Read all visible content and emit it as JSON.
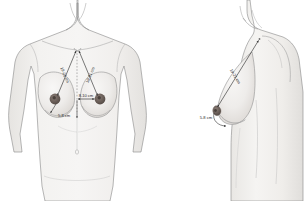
{
  "figure": {
    "background_color": "#ffffff",
    "skin_fill": "#efeeec",
    "skin_fill_shadow": "#e2e0dd",
    "outline_color": "#8a8a8a",
    "areola_color": "#6e6460",
    "measure_line_color": "#3a3a3a",
    "label_color": "#2b2b2b",
    "views": [
      {
        "name": "anterior-view",
        "label": "Anterior (frontal) view",
        "measurements": [
          {
            "id": "sternal-notch-to-left-nipple",
            "text": "19-21 cm",
            "description": "Suprasternal notch to nipple, patient left",
            "orientation": "diagonal"
          },
          {
            "id": "sternal-notch-to-right-nipple",
            "text": "19-21 cm",
            "description": "Suprasternal notch to nipple, patient right",
            "orientation": "diagonal"
          },
          {
            "id": "midline-to-nipple",
            "text": "8-10 cm",
            "description": "Anterior midline to nipple",
            "orientation": "horizontal"
          },
          {
            "id": "nipple-to-inframammary-fold-front",
            "text": "5-8 cm",
            "description": "Nipple to inframammary fold",
            "orientation": "vertical"
          }
        ]
      },
      {
        "name": "lateral-view",
        "label": "Lateral (profile) view",
        "measurements": [
          {
            "id": "sternal-notch-to-nipple-lateral",
            "text": "19-21 cm",
            "description": "Suprasternal notch to nipple in profile",
            "orientation": "diagonal"
          },
          {
            "id": "nipple-to-inframammary-fold-lateral",
            "text": "5-8 cm",
            "description": "Nipple to inframammary fold in profile",
            "orientation": "curved"
          }
        ]
      }
    ]
  }
}
